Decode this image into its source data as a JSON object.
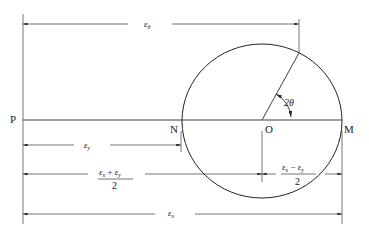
{
  "diagram": {
    "type": "mohr-circle-strain",
    "points": {
      "P": "P",
      "N": "N",
      "O": "O",
      "M": "M"
    },
    "angle_label": "2θ",
    "dimensions": {
      "eps_theta": {
        "sym": "ε",
        "sub": "θ"
      },
      "eps_y": {
        "sym": "ε",
        "sub": "y"
      },
      "avg": {
        "num_a_sym": "ε",
        "num_a_sub": "x",
        "op": "+",
        "num_b_sym": "ε",
        "num_b_sub": "y",
        "den": "2"
      },
      "half_diff": {
        "num_a_sym": "ε",
        "num_a_sub": "x",
        "op": "−",
        "num_b_sym": "ε",
        "num_b_sub": "y",
        "den": "2"
      },
      "eps_x": {
        "sym": "ε",
        "sub": "x"
      }
    },
    "colors": {
      "stroke": "#222222",
      "background": "#ffffff"
    }
  }
}
